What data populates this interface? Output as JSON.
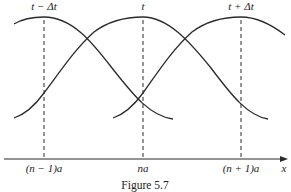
{
  "figure": {
    "caption": "Figure 5.7",
    "time_labels": [
      "t − Δt",
      "t",
      "t + Δt"
    ],
    "position_labels": [
      "(n − 1)a",
      "na",
      "(n + 1)a"
    ],
    "axis_label": "x",
    "stroke_color": "#2a2a2a"
  },
  "curves": [
    {
      "name": "wave at t - Δt",
      "peak_at": "(n − 1)a"
    },
    {
      "name": "wave at t",
      "peak_at": "na"
    },
    {
      "name": "wave at t + Δt",
      "peak_at": "(n + 1)a"
    }
  ]
}
